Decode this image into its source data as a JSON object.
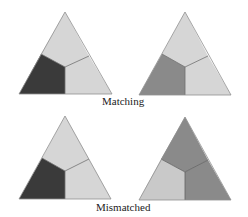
{
  "labels": {
    "matching": "Matching",
    "mismatched": "Mismatched"
  },
  "colors": {
    "outline": "#8f8f8f",
    "divider": "#6f6f6f",
    "dark": "#3a3a3a",
    "medium": "#8a8a8a",
    "light": "#d6d6d6",
    "light_alt": "#c9c9c9"
  },
  "triangles": [
    {
      "id": "top-left",
      "row": "matching",
      "regions": {
        "left": "dark",
        "top": "light",
        "right": "light"
      }
    },
    {
      "id": "top-right",
      "row": "matching",
      "regions": {
        "left": "medium",
        "top": "light",
        "right": "light"
      }
    },
    {
      "id": "bottom-left",
      "row": "mismatched",
      "regions": {
        "left": "dark",
        "top": "light",
        "right": "light"
      }
    },
    {
      "id": "bottom-right",
      "row": "mismatched",
      "regions": {
        "left": "light_alt",
        "top": "medium",
        "right": "medium"
      }
    }
  ]
}
